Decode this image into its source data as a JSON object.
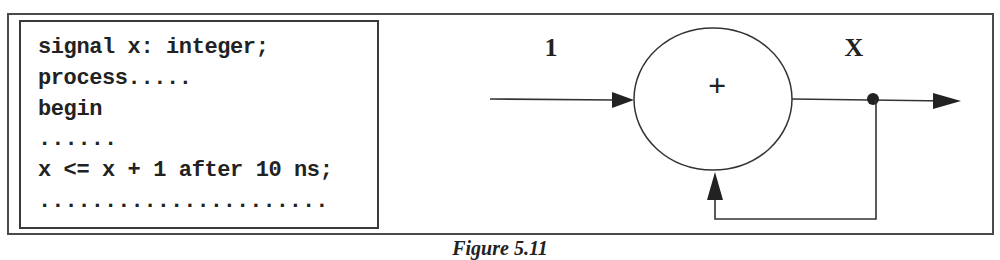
{
  "code": {
    "lines": [
      "signal x: integer;",
      "process.....",
      "begin",
      "......",
      "x <= x + 1 after 10 ns;",
      "......................"
    ]
  },
  "diagram": {
    "input_label": "1",
    "operator_symbol": "+",
    "output_label": "X",
    "nodes": [
      {
        "id": "adder",
        "shape": "ellipse",
        "symbol": "+"
      },
      {
        "id": "junction",
        "shape": "dot"
      }
    ],
    "edges": [
      {
        "from": "input",
        "to": "adder",
        "label": "1"
      },
      {
        "from": "adder",
        "to": "junction"
      },
      {
        "from": "junction",
        "to": "output",
        "label": "X"
      },
      {
        "from": "junction",
        "to": "adder",
        "kind": "feedback"
      }
    ]
  },
  "caption": "Figure 5.11"
}
